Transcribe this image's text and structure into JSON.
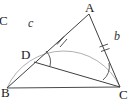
{
  "figure": {
    "type": "geometry-diagram",
    "background": "#ffffff",
    "stroke_color": "#3a3a3a",
    "arc_color": "#9a9a9a",
    "width": 134,
    "height": 105
  },
  "vertices": {
    "A": {
      "label": "A",
      "x": 89,
      "y": 14
    },
    "B": {
      "label": "B",
      "x": 7,
      "y": 88
    },
    "C": {
      "label": "C",
      "x": 120,
      "y": 87
    },
    "D": {
      "label": "D",
      "x": 34,
      "y": 62
    }
  },
  "side_labels": {
    "c": "c",
    "b": "b",
    "C_outer": "C"
  },
  "segments": [
    {
      "name": "BA",
      "from": "B",
      "to": "A"
    },
    {
      "name": "AC",
      "from": "A",
      "to": "C"
    },
    {
      "name": "BC",
      "from": "B",
      "to": "C"
    },
    {
      "name": "DC",
      "from": "D",
      "to": "C"
    }
  ],
  "tick_marks": [
    {
      "name": "tick-DA",
      "segment": "DA",
      "count": 2
    },
    {
      "name": "tick-AC",
      "segment": "AC",
      "count": 2
    }
  ],
  "angle_arcs": [
    {
      "name": "angle-at-D",
      "vertex": "D"
    },
    {
      "name": "angle-at-C",
      "vertex": "C"
    }
  ],
  "arc": {
    "name": "circular-arc-BAC",
    "through": [
      "B",
      "A",
      "C"
    ]
  }
}
